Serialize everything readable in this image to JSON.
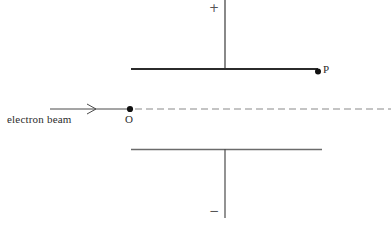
{
  "diagram": {
    "colors": {
      "background": "#ffffff",
      "line": "#3a3a3a",
      "plate_top": "#2b2b2b",
      "plate_bottom": "#6b6b6b",
      "dash": "#8a8a8a",
      "dot": "#111111",
      "sign": "#555555"
    },
    "labels": {
      "plus_sign": "+",
      "minus_sign": "−",
      "point_p": "P",
      "point_o": "O",
      "beam_caption": "electron beam"
    },
    "elements": {
      "top_lead_line": {
        "x": 225,
        "y1": 0,
        "y2": 69,
        "width": 1
      },
      "top_plate": {
        "x1": 131,
        "x2": 318,
        "y": 69,
        "width": 2
      },
      "bottom_plate": {
        "x1": 131,
        "x2": 322,
        "y": 149,
        "width": 1.4
      },
      "bottom_lead_line": {
        "x": 225,
        "y1": 149,
        "y2": 218,
        "width": 1
      },
      "beam_axis_y": 109,
      "beam_solid": {
        "x1": 50,
        "x2": 131
      },
      "beam_dashed": {
        "x1": 134,
        "x2": 391,
        "dash": "7 4"
      },
      "arrowhead": {
        "x": 95,
        "y": 109
      },
      "dot_o": {
        "x": 130,
        "y": 109,
        "r": 3
      },
      "dot_p": {
        "x": 318,
        "y": 71,
        "r": 3
      }
    }
  }
}
